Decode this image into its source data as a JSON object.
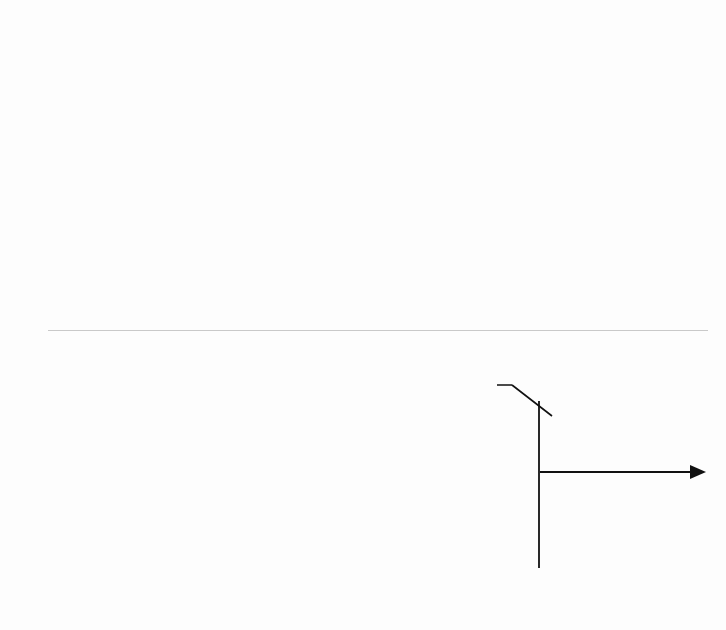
{
  "figure": {
    "panel_divider": "horizontal-rule"
  },
  "chart_data": [
    {
      "id": "top",
      "type": "line",
      "title": "",
      "xlabel": "Time [sec]",
      "ylabel": "Roll angle [deg]",
      "xlim": [
        0,
        21.5
      ],
      "ylim": [
        -15,
        15
      ],
      "xticks": [
        0,
        5,
        10,
        15,
        20
      ],
      "xtick_labels": [
        "0",
        "5",
        "10",
        "15",
        "20"
      ],
      "yticks": [
        15,
        10,
        5,
        0,
        -5,
        -10,
        -15
      ],
      "ytick_labels": [
        "15",
        "10",
        "5",
        "0",
        "-5",
        "-10",
        "-15"
      ],
      "grid": true,
      "legend": null,
      "line_color": "#8d8d8d",
      "series": [
        {
          "name": "Roll angle",
          "x": [
            0.0,
            0.2,
            0.4,
            0.6,
            0.8,
            1.0,
            1.2,
            1.4,
            1.6,
            1.75,
            1.9,
            2.0,
            2.1,
            2.2,
            2.35,
            2.5,
            2.6,
            2.7,
            2.8,
            2.9,
            3.0,
            3.1,
            3.2,
            3.3,
            3.4,
            3.5,
            3.6,
            3.7,
            3.8,
            3.9,
            4.0,
            4.1,
            4.2,
            4.3,
            4.4,
            4.5,
            4.6,
            4.7,
            4.8,
            4.9,
            5.0,
            5.1,
            5.2,
            5.3,
            5.4,
            5.5,
            5.6,
            5.7,
            5.8,
            5.9,
            6.0,
            6.1,
            6.2,
            6.3,
            6.4,
            6.5,
            6.6,
            6.7,
            6.8,
            6.9,
            7.0,
            7.1,
            7.2,
            7.3,
            7.4,
            7.5,
            7.6,
            7.7,
            7.8,
            7.9,
            8.0,
            8.1,
            8.2,
            8.3,
            8.4,
            8.5,
            8.6,
            8.7,
            8.8,
            8.9,
            9.0,
            9.1,
            9.2,
            9.3,
            9.4,
            9.5,
            9.6,
            9.7,
            9.8,
            9.9,
            10.0,
            10.1,
            10.2,
            10.3,
            10.4,
            10.6,
            10.8,
            11.0,
            11.2,
            11.4,
            11.6,
            11.8,
            12.0,
            12.2,
            12.4,
            12.6,
            12.8,
            13.0,
            13.2,
            13.4,
            13.6,
            13.8,
            14.0,
            14.2,
            14.4,
            14.6,
            14.8,
            15.0,
            15.2,
            15.4,
            15.6,
            15.8,
            16.0,
            16.2,
            16.35,
            16.5,
            16.6,
            16.7,
            16.8,
            16.9,
            17.0,
            17.1,
            17.2,
            17.3,
            17.4,
            17.5,
            17.6,
            17.7,
            17.8,
            17.9,
            18.0,
            18.1,
            18.2,
            18.3,
            18.4,
            18.5,
            18.6,
            18.7,
            18.8,
            18.9,
            19.0,
            19.1,
            19.2,
            19.3,
            19.4,
            19.5,
            19.6,
            19.7,
            19.8,
            19.9,
            20.0,
            20.1,
            20.2,
            20.3,
            20.4,
            20.5,
            20.6,
            20.7,
            20.8,
            20.9,
            21.0,
            21.1,
            21.2,
            21.3
          ],
          "y": [
            0.6,
            0.6,
            0.55,
            0.6,
            0.55,
            0.6,
            0.55,
            0.6,
            0.55,
            0.6,
            0.2,
            -0.8,
            -2.0,
            -3.2,
            -4.3,
            -4.9,
            -5.2,
            -5.1,
            -5.4,
            -5.2,
            -5.5,
            -5.9,
            -6.0,
            -6.4,
            -6.2,
            -6.8,
            -7.2,
            -7.5,
            -7.3,
            -7.4,
            -7.1,
            -7.2,
            -6.8,
            -6.9,
            -6.6,
            -5.6,
            -4.4,
            -3.2,
            -2.0,
            -0.9,
            0.3,
            1.1,
            0.7,
            0.9,
            0.4,
            0.8,
            0.5,
            0.9,
            0.6,
            1.0,
            0.7,
            1.1,
            0.8,
            0.6,
            1.0,
            0.7,
            1.1,
            0.8,
            1.0,
            0.6,
            1.1,
            0.9,
            0.5,
            0.0,
            -0.8,
            -1.6,
            -2.0,
            -1.6,
            -0.9,
            -0.2,
            0.4,
            0.8,
            1.2,
            1.0,
            1.4,
            1.1,
            1.5,
            1.2,
            0.9,
            0.4,
            -0.4,
            -1.3,
            -2.2,
            -2.8,
            -3.0,
            -2.9,
            -2.6,
            -1.8,
            -0.6,
            0.5,
            1.3,
            1.8,
            1.6,
            1.3,
            1.1,
            0.8,
            0.6,
            0.9,
            0.5,
            0.8,
            0.4,
            0.7,
            0.3,
            0.6,
            0.2,
            0.5,
            0.9,
            0.5,
            0.8,
            0.4,
            0.7,
            0.3,
            0.6,
            0.2,
            0.5,
            0.8,
            0.4,
            0.7,
            0.2,
            0.5,
            0.1,
            -0.2,
            0.1,
            -0.3,
            0.0,
            -0.4,
            -0.1,
            0.2,
            0.6,
            1.2,
            2.6,
            4.5,
            4.3,
            3.9,
            4.2,
            2.6,
            1.2,
            0.4,
            0.9,
            1.5,
            0.6,
            0.0,
            1.8,
            5.0,
            6.6,
            7.1,
            6.4,
            6.5,
            5.9,
            5.7,
            5.6,
            5.4,
            2.8,
            0.2,
            -1.2,
            -1.9,
            -2.0,
            -1.6,
            -0.8,
            0.4,
            1.1,
            0.7,
            1.4,
            2.0,
            1.6,
            0.9,
            1.3,
            0.2,
            -2.4,
            0.6,
            3.9,
            1.1,
            -0.6,
            -0.9,
            -0.6,
            -0.4
          ]
        }
      ],
      "annotations": []
    },
    {
      "id": "bottom",
      "type": "line",
      "title": "",
      "xlabel": "Time [sec]",
      "ylabel": "Roll angle [deg]",
      "xlim": [
        0,
        12.2
      ],
      "ylim": [
        -15,
        15
      ],
      "xticks": [
        0,
        5,
        10
      ],
      "xtick_labels": [
        "0",
        "5",
        "10"
      ],
      "yticks": [
        15,
        10,
        5,
        0,
        -5,
        -10,
        -15
      ],
      "ytick_labels": [
        "15",
        "10",
        "5",
        "0",
        "-5",
        "-10",
        "-15"
      ],
      "grid": true,
      "legend": null,
      "line_color": "#8d8d8d",
      "series": [
        {
          "name": "Roll angle",
          "x": [
            0.0,
            0.2,
            0.4,
            0.6,
            0.8,
            1.0,
            1.2,
            1.4,
            1.6,
            1.75,
            1.9,
            2.0,
            2.1,
            2.2,
            2.3,
            2.4,
            2.5,
            2.6,
            2.7,
            2.8,
            2.9,
            3.0,
            3.1,
            3.2,
            3.3,
            3.4,
            3.5,
            3.6,
            3.7,
            3.8,
            3.9,
            4.0,
            4.1,
            4.2,
            4.3,
            4.4,
            4.5,
            4.6,
            4.7,
            4.8,
            4.9,
            5.0,
            5.05,
            5.1,
            5.15,
            5.2,
            5.3,
            5.4,
            5.5,
            5.6,
            5.7,
            5.8,
            5.9,
            6.0,
            6.1,
            6.2,
            6.3,
            6.4,
            6.5,
            6.6,
            6.7,
            6.8,
            6.9,
            7.0,
            7.1,
            7.2,
            7.3,
            7.4,
            7.5,
            7.6,
            7.7,
            7.8,
            7.9,
            8.0,
            8.1,
            8.2,
            8.3,
            8.4,
            8.5,
            8.6,
            8.7,
            8.8,
            8.85,
            8.9,
            8.95,
            9.0,
            9.05,
            9.1,
            9.15,
            9.2,
            9.25,
            9.3,
            9.35,
            9.4,
            9.45,
            9.5,
            9.55,
            9.6,
            9.65,
            9.7,
            9.8,
            9.9,
            10.0,
            10.1,
            10.2,
            10.3,
            10.4,
            10.5,
            10.6,
            10.7,
            10.8,
            10.9,
            11.0,
            11.1,
            11.2,
            11.3,
            11.4,
            11.5,
            11.6,
            11.7,
            11.8,
            11.9,
            12.0,
            12.1
          ],
          "y": [
            -0.5,
            -0.5,
            -0.45,
            -0.5,
            -0.45,
            -0.5,
            -0.45,
            -0.5,
            -0.45,
            -0.5,
            -1.0,
            -2.0,
            -3.2,
            -4.4,
            -5.6,
            -6.8,
            -7.9,
            -8.8,
            -9.6,
            -10.4,
            -11.1,
            -11.7,
            -12.1,
            -12.3,
            -12.2,
            -12.3,
            -12.2,
            -12.0,
            -11.4,
            -10.4,
            -9.2,
            -7.9,
            -6.5,
            -5.1,
            -3.7,
            -2.3,
            -1.0,
            0.2,
            1.1,
            1.4,
            1.0,
            1.2,
            0.6,
            -2.0,
            -4.4,
            -5.7,
            -4.0,
            -2.4,
            -1.9,
            -1.5,
            -1.8,
            -1.2,
            -0.4,
            0.8,
            2.0,
            2.8,
            2.5,
            1.7,
            0.6,
            -0.6,
            -1.4,
            -1.8,
            -1.6,
            -1.5,
            -1.4,
            -1.6,
            -1.3,
            -1.5,
            -0.9,
            -0.1,
            0.9,
            1.1,
            0.8,
            1.1,
            0.9,
            1.2,
            1.0,
            1.2,
            1.0,
            0.8,
            0.6,
            0.4,
            0.3,
            0.8,
            2.2,
            5.2,
            9.0,
            12.2,
            14.0,
            14.3,
            13.0,
            10.0,
            8.3,
            8.0,
            7.9,
            7.6,
            5.0,
            1.0,
            -2.0,
            -3.0,
            -2.0,
            1.8,
            5.8,
            1.0,
            0.9,
            1.2,
            1.1,
            1.3,
            1.2,
            1.4,
            1.3,
            0.2,
            1.3,
            1.4,
            1.3,
            1.4,
            0.3,
            1.4,
            1.3,
            1.4,
            1.3,
            1.4,
            1.3,
            1.4,
            1.4,
            1.5
          ]
        }
      ],
      "annotations": [
        {
          "id": "ducted-fan",
          "text": "Ducted fan angle change",
          "leader": true
        },
        {
          "id": "zero-attitude",
          "line1": "Zero attitude",
          "line2": "lateral translation",
          "marker": "vertical-line-with-arrow"
        }
      ]
    }
  ]
}
